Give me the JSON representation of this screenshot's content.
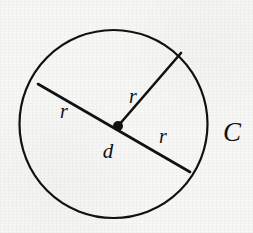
{
  "figure": {
    "kind": "geometry-diagram",
    "background_color": "#f7f7f5",
    "ink_color": "#111111",
    "canvas": {
      "width": 253,
      "height": 233
    }
  },
  "circle": {
    "name": "circle-outline",
    "center": {
      "x": 113.5,
      "y": 124
    },
    "radius": 94,
    "stroke_width": 2.2
  },
  "center_point": {
    "name": "center-dot",
    "x": 118,
    "y": 126,
    "radius": 5
  },
  "segments": [
    {
      "id": "diameter",
      "name": "diameter-line",
      "label": "d",
      "from": {
        "x": 38,
        "y": 84
      },
      "to": {
        "x": 190,
        "y": 172
      },
      "stroke_width": 2.4
    },
    {
      "id": "radius-upper-right",
      "name": "radius-line-upper-right",
      "label": "r",
      "from": {
        "x": 118,
        "y": 126
      },
      "to": {
        "x": 181,
        "y": 53
      },
      "stroke_width": 2.4
    }
  ],
  "labels": [
    {
      "id": "r-left",
      "name": "radius-label-left",
      "text": "r",
      "x": 64,
      "y": 118
    },
    {
      "id": "r-top",
      "name": "radius-label-upper-right",
      "text": "r",
      "x": 133,
      "y": 103
    },
    {
      "id": "r-right",
      "name": "radius-label-lower-right",
      "text": "r",
      "x": 163,
      "y": 143
    },
    {
      "id": "d",
      "name": "diameter-label",
      "text": "d",
      "x": 108,
      "y": 158
    },
    {
      "id": "C",
      "name": "circumference-label",
      "text": "C",
      "x": 232,
      "y": 141
    }
  ]
}
